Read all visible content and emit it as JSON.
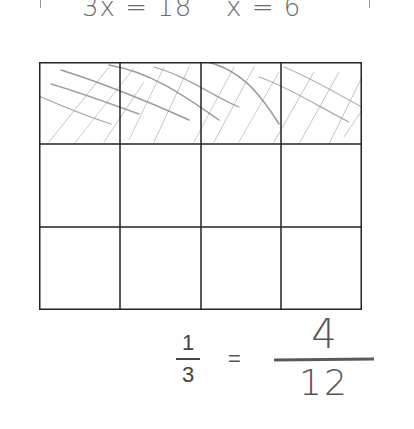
{
  "top_equations": [
    {
      "text": "3x = 18"
    },
    {
      "text": "x = 6"
    }
  ],
  "grid": {
    "rows": 3,
    "columns": 4,
    "shaded_row": 0,
    "shaded_cells": 4,
    "total_cells": 12,
    "line_color": "#222222",
    "hatch_color": "#8a8a8a"
  },
  "printed_fraction": {
    "numerator": "1",
    "denominator": "3"
  },
  "equals_sign": "=",
  "handwritten_fraction": {
    "numerator": "4",
    "denominator": "12"
  }
}
